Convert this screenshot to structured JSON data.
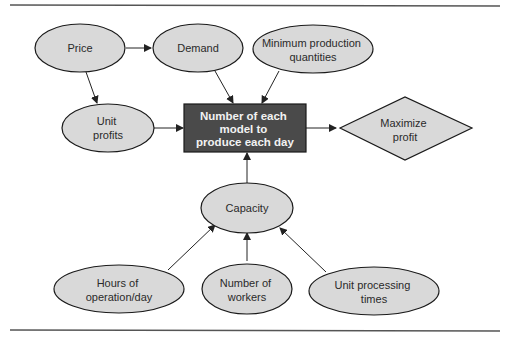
{
  "diagram": {
    "type": "influence-diagram",
    "colors": {
      "node_fill": "#d9d9d9",
      "node_stroke": "#1a1a1a",
      "decision_fill": "#4a4a4a",
      "decision_text": "#f2f2f2",
      "rule": "#555555",
      "arrow": "#222222"
    },
    "nodes": {
      "price": {
        "shape": "ellipse",
        "lines": [
          "Price"
        ]
      },
      "demand": {
        "shape": "ellipse",
        "lines": [
          "Demand"
        ]
      },
      "min_prod": {
        "shape": "ellipse",
        "lines": [
          "Minimum production",
          "quantities"
        ]
      },
      "unit_profits": {
        "shape": "ellipse",
        "lines": [
          "Unit",
          "profits"
        ]
      },
      "decision": {
        "shape": "rectangle",
        "lines": [
          "Number of each",
          "model to",
          "produce each day"
        ]
      },
      "objective": {
        "shape": "diamond",
        "lines": [
          "Maximize",
          "profit"
        ]
      },
      "capacity": {
        "shape": "ellipse",
        "lines": [
          "Capacity"
        ]
      },
      "hours": {
        "shape": "ellipse",
        "lines": [
          "Hours of",
          "operation/day"
        ]
      },
      "workers": {
        "shape": "ellipse",
        "lines": [
          "Number of",
          "workers"
        ]
      },
      "processing": {
        "shape": "ellipse",
        "lines": [
          "Unit processing",
          "times"
        ]
      }
    },
    "edges": [
      {
        "from": "Price",
        "to": "Demand"
      },
      {
        "from": "Price",
        "to": "Unit profits"
      },
      {
        "from": "Demand",
        "to": "Number of each model to produce each day"
      },
      {
        "from": "Minimum production quantities",
        "to": "Number of each model to produce each day"
      },
      {
        "from": "Unit profits",
        "to": "Number of each model to produce each day"
      },
      {
        "from": "Number of each model to produce each day",
        "to": "Maximize profit"
      },
      {
        "from": "Capacity",
        "to": "Number of each model to produce each day"
      },
      {
        "from": "Hours of operation/day",
        "to": "Capacity"
      },
      {
        "from": "Number of workers",
        "to": "Capacity"
      },
      {
        "from": "Unit processing times",
        "to": "Capacity"
      }
    ]
  }
}
